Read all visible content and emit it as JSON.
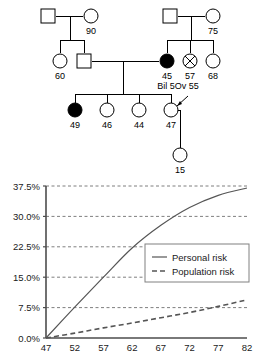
{
  "pedigree": {
    "title": "family-pedigree",
    "symbols": [
      {
        "id": "gen1-father-left",
        "shape": "square",
        "fill": "unaffected",
        "label": "",
        "cx": 48,
        "cy": 16
      },
      {
        "id": "gen1-mother-left",
        "shape": "circle",
        "fill": "unaffected",
        "label": "90",
        "cx": 91,
        "cy": 16
      },
      {
        "id": "gen1-father-right",
        "shape": "square",
        "fill": "unaffected",
        "label": "",
        "cx": 170,
        "cy": 16
      },
      {
        "id": "gen1-mother-right",
        "shape": "circle",
        "fill": "unaffected",
        "label": "75",
        "cx": 213,
        "cy": 16
      },
      {
        "id": "gen2-sister-60",
        "shape": "circle",
        "fill": "unaffected",
        "label": "60",
        "cx": 60,
        "cy": 61
      },
      {
        "id": "gen2-brother",
        "shape": "square",
        "fill": "unaffected",
        "label": "",
        "cx": 84,
        "cy": 61
      },
      {
        "id": "gen2-mother-45",
        "shape": "circle",
        "fill": "affected",
        "label": "45",
        "cx": 167,
        "cy": 61
      },
      {
        "id": "gen2-sister-57",
        "shape": "circle",
        "fill": "deceased",
        "label": "57",
        "cx": 190,
        "cy": 61
      },
      {
        "id": "gen2-sister-68",
        "shape": "circle",
        "fill": "unaffected",
        "label": "68",
        "cx": 213,
        "cy": 61
      },
      {
        "id": "gen3-daughter-49",
        "shape": "circle",
        "fill": "affected",
        "label": "49",
        "cx": 75,
        "cy": 110
      },
      {
        "id": "gen3-daughter-46",
        "shape": "circle",
        "fill": "unaffected",
        "label": "46",
        "cx": 107,
        "cy": 110
      },
      {
        "id": "gen3-daughter-44",
        "shape": "circle",
        "fill": "unaffected",
        "label": "44",
        "cx": 139,
        "cy": 110
      },
      {
        "id": "gen3-proband-47",
        "shape": "circle",
        "fill": "unaffected",
        "label": "47",
        "cx": 171,
        "cy": 110
      },
      {
        "id": "gen4-daughter-15",
        "shape": "circle",
        "fill": "unaffected",
        "label": "15",
        "cx": 180,
        "cy": 155
      }
    ],
    "annotation": "Bil 5Ov 55",
    "proband_marker": "proband-arrow"
  },
  "chart_data": {
    "type": "line",
    "title": "",
    "xlabel": "",
    "ylabel": "",
    "xlim": [
      47,
      82
    ],
    "ylim": [
      0,
      37.5
    ],
    "grid": true,
    "legend_position": "center-right",
    "x_ticks": [
      "47",
      "52",
      "57",
      "62",
      "67",
      "72",
      "77",
      "82"
    ],
    "y_ticks": [
      "0.0%",
      "7.5%",
      "15.0%",
      "22.5%",
      "30.0%",
      "37.5%"
    ],
    "x": [
      47,
      52,
      57,
      62,
      67,
      72,
      77,
      82
    ],
    "series": [
      {
        "name": "Personal risk",
        "style": "solid",
        "color": "#555555",
        "values": [
          0.0,
          7.6,
          15.0,
          22.2,
          27.8,
          32.2,
          35.2,
          37.0
        ]
      },
      {
        "name": "Population risk",
        "style": "dashed",
        "color": "#555555",
        "values": [
          0.0,
          1.2,
          2.5,
          3.7,
          5.0,
          6.3,
          7.8,
          9.4
        ]
      }
    ]
  },
  "legend": {
    "items": [
      {
        "label": "Personal risk",
        "style": "solid"
      },
      {
        "label": "Population risk",
        "style": "dashed"
      }
    ]
  }
}
